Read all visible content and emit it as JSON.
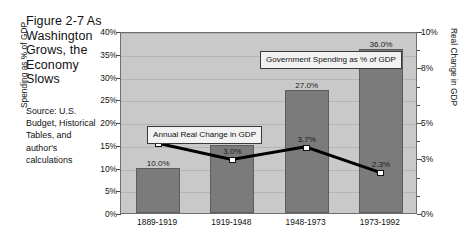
{
  "figure": {
    "title": "Figure 2-7 As Washington Grows, the Economy Slows",
    "source": "Source: U.S. Budget, Historical Tables, and author's calculations"
  },
  "callouts": {
    "gdp_change": "Annual Real Change in GDP",
    "gov_spending": "Government Spending as % of GDP"
  },
  "chart_data": {
    "type": "bar",
    "title": "As Washington Grows, the Economy Slows",
    "categories": [
      "1889-1919",
      "1919-1948",
      "1948-1973",
      "1973-1992"
    ],
    "xlabel": "",
    "grid": true,
    "legend": "annotations",
    "series": [
      {
        "name": "Government Spending as % of GDP",
        "type": "bar",
        "axis": "left",
        "values": [
          10.0,
          15.0,
          27.0,
          36.0
        ],
        "labels": [
          "10.0%",
          "15.0%",
          "27.0%",
          "36.0%"
        ],
        "color": "#7b7b7b"
      },
      {
        "name": "Annual Real Change in GDP",
        "type": "line",
        "axis": "right",
        "values": [
          3.9,
          3.0,
          3.7,
          2.3
        ],
        "labels": [
          "3.9%",
          "3.0%",
          "3.7%",
          "2.3%"
        ],
        "color": "#000000",
        "marker": "square-white"
      }
    ],
    "y_left": {
      "label": "Spending as % of GDP",
      "min": 0,
      "max": 40,
      "ticks": [
        0,
        5,
        10,
        15,
        20,
        25,
        30,
        35,
        40
      ],
      "tick_labels": [
        "0%",
        "5%",
        "10%",
        "15%",
        "20%",
        "25%",
        "30%",
        "35%",
        "40%"
      ]
    },
    "y_right": {
      "label": "Real Change in GDP",
      "min": 0,
      "max": 10,
      "ticks": [
        0,
        3,
        5,
        8,
        10
      ],
      "tick_labels": [
        "0%",
        "3%",
        "5%",
        "8%",
        "10%"
      ]
    }
  }
}
